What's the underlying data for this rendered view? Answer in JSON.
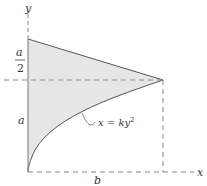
{
  "diagram": {
    "labels": {
      "y_axis": "y",
      "x_axis": "x",
      "half_a_num": "a",
      "half_a_den": "2",
      "a": "a",
      "b": "b",
      "curve_eq": "x = ky",
      "curve_exp": "2"
    },
    "colors": {
      "fill": "#e6e6e6",
      "line": "#555555",
      "dash": "#777777"
    }
  }
}
